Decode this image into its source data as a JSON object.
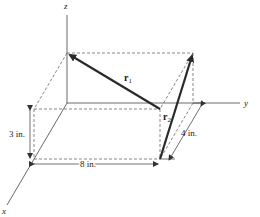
{
  "diagram": {
    "axes": {
      "x": "x",
      "y": "y",
      "z": "z"
    },
    "vectors": [
      {
        "name": "r",
        "subscript": "1"
      },
      {
        "name": "r",
        "subscript": "2"
      }
    ],
    "dimensions": {
      "height": "3 in.",
      "length": "8 in.",
      "depth": "4 in."
    },
    "colors": {
      "line": "#333333",
      "vector": "#2a2a2a"
    }
  }
}
